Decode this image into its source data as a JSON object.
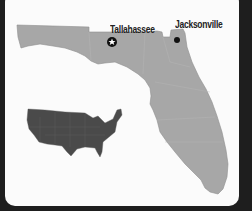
{
  "map": {
    "title": "Florida",
    "cities": [
      {
        "name": "Tallahassee",
        "marker": "star-icon",
        "role": "capital"
      },
      {
        "name": "Jacksonville",
        "marker": "dot-icon",
        "role": "city"
      }
    ],
    "inset": {
      "name": "United States"
    },
    "colors": {
      "state_fill": "#a4a4a4",
      "inset_fill": "#4a4a4a",
      "background": "#fbfbfb",
      "frame": "#1e1e1e"
    }
  }
}
